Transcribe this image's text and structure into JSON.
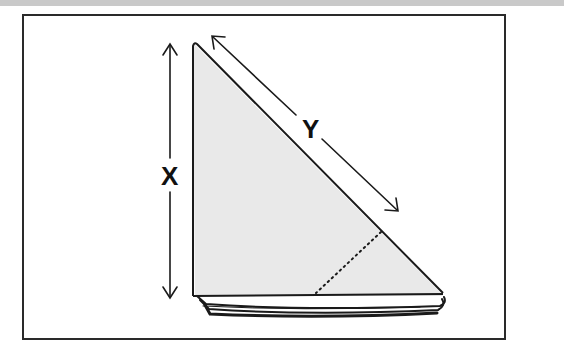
{
  "diagram": {
    "labels": {
      "x": "X",
      "y": "Y"
    },
    "dimensions": [
      {
        "label": "X",
        "meaning": "vertical height of triangle",
        "orientation": "vertical"
      },
      {
        "label": "Y",
        "meaning": "length of diagonal edge",
        "orientation": "diagonal"
      }
    ],
    "colors": {
      "fill": "#e9e9e9",
      "stroke": "#1a1a1a",
      "frame": "#2a2a2a",
      "top_band": "#c9c9c9"
    },
    "features": [
      "dotted fold line",
      "stacked folded edges at base"
    ]
  }
}
